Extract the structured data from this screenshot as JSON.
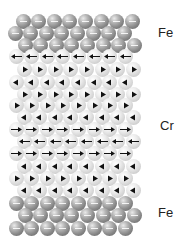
{
  "labels": {
    "top": "Fe",
    "middle": "Cr",
    "bottom": "Fe"
  },
  "layers": [
    {
      "element": "Fe",
      "rows": [
        {
          "y": 21,
          "x0": 23,
          "dir": "none"
        },
        {
          "y": 33,
          "x0": 15,
          "dir": "none"
        },
        {
          "y": 45,
          "x0": 25,
          "dir": "none"
        }
      ]
    },
    {
      "element": "Cr",
      "rows": [
        {
          "y": 56,
          "x0": 16,
          "dir": "left",
          "style": "long"
        },
        {
          "y": 69,
          "x0": 24,
          "dir": "right",
          "style": "head"
        },
        {
          "y": 82,
          "x0": 16,
          "dir": "left",
          "style": "head"
        },
        {
          "y": 94,
          "x0": 24,
          "dir": "right",
          "style": "head"
        },
        {
          "y": 105,
          "x0": 16,
          "dir": "right",
          "style": "head"
        },
        {
          "y": 117,
          "x0": 24,
          "dir": "left",
          "style": "head"
        },
        {
          "y": 129,
          "x0": 16,
          "dir": "right",
          "style": "long"
        },
        {
          "y": 141,
          "x0": 24,
          "dir": "left",
          "style": "long"
        },
        {
          "y": 153,
          "x0": 16,
          "dir": "right",
          "style": "long"
        },
        {
          "y": 166,
          "x0": 24,
          "dir": "left",
          "style": "head"
        },
        {
          "y": 178,
          "x0": 16,
          "dir": "right",
          "style": "head"
        },
        {
          "y": 190,
          "x0": 24,
          "dir": "left",
          "style": "head"
        }
      ]
    },
    {
      "element": "Fe",
      "rows": [
        {
          "y": 203,
          "x0": 16,
          "dir": "none"
        },
        {
          "y": 215,
          "x0": 25,
          "dir": "none"
        },
        {
          "y": 228,
          "x0": 16,
          "dir": "none"
        }
      ]
    }
  ],
  "atoms_per_row": 8,
  "spacing": 15.6,
  "colors": {
    "fe": "#8a8a8a",
    "cr": "#d2d2d2",
    "arrow": "#111111"
  }
}
